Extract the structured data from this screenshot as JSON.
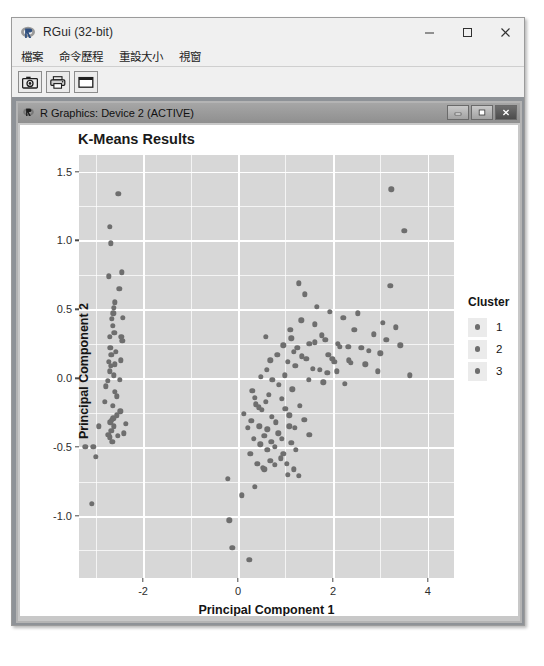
{
  "window": {
    "app_icon": "r-logo-icon",
    "title": "RGui (32-bit)",
    "minimize_label": "─",
    "maximize_label": "□",
    "close_label": "✕",
    "menus": [
      {
        "name": "file",
        "label": "檔案"
      },
      {
        "name": "history",
        "label": "命令歷程"
      },
      {
        "name": "resize",
        "label": "重設大小"
      },
      {
        "name": "windows",
        "label": "視窗"
      }
    ],
    "toolbar": [
      {
        "name": "copy-to-clipboard",
        "icon": "camera-icon"
      },
      {
        "name": "print",
        "icon": "printer-icon"
      },
      {
        "name": "window",
        "icon": "window-icon"
      }
    ]
  },
  "device_window": {
    "icon": "r-logo-icon",
    "title": "R Graphics: Device 2 (ACTIVE)",
    "minimize_label": "–",
    "restore_label": "□",
    "close_label": "✕"
  },
  "chart_data": {
    "type": "scatter",
    "title": "K-Means Results",
    "xlabel": "Principal Component 1",
    "ylabel": "Principal Component 2",
    "xlim": [
      -3.35,
      4.55
    ],
    "ylim": [
      -1.45,
      1.62
    ],
    "xticks": [
      -2,
      0,
      2,
      4
    ],
    "xtick_labels": [
      "-2",
      "0",
      "2",
      "4"
    ],
    "yticks": [
      -1.0,
      -0.5,
      0.0,
      0.5,
      1.0,
      1.5
    ],
    "ytick_labels": [
      "-1.0",
      "-0.5",
      "0.0",
      "0.5",
      "1.0",
      "1.5"
    ],
    "grid": true,
    "panel_bg": "#d7d7d7",
    "grid_color": "#ffffff",
    "legend": {
      "title": "Cluster",
      "position": "right",
      "entries": [
        {
          "label": "1",
          "color": "#6e6e6e"
        },
        {
          "label": "2",
          "color": "#6e6e6e"
        },
        {
          "label": "3",
          "color": "#6e6e6e"
        }
      ]
    },
    "series": [
      {
        "name": "1",
        "color": "#6e6e6e",
        "points": [
          [
            -2.52,
            1.34
          ],
          [
            -2.7,
            1.1
          ],
          [
            -2.68,
            0.98
          ],
          [
            -2.45,
            0.77
          ],
          [
            -2.72,
            0.74
          ],
          [
            -2.5,
            0.65
          ],
          [
            -2.6,
            0.55
          ],
          [
            -2.62,
            0.51
          ],
          [
            -2.63,
            0.47
          ],
          [
            -2.66,
            0.43
          ],
          [
            -2.64,
            0.38
          ],
          [
            -2.61,
            0.33
          ],
          [
            -2.7,
            0.3
          ],
          [
            -2.46,
            0.3
          ],
          [
            -2.44,
            0.27
          ],
          [
            -2.69,
            0.22
          ],
          [
            -2.67,
            0.17
          ],
          [
            -2.72,
            0.12
          ],
          [
            -2.68,
            0.09
          ],
          [
            -2.7,
            0.05
          ],
          [
            -2.62,
            0.02
          ],
          [
            -2.74,
            -0.02
          ],
          [
            -2.78,
            -0.06
          ],
          [
            -2.59,
            -0.1
          ],
          [
            -2.55,
            -0.13
          ],
          [
            -2.8,
            -0.17
          ],
          [
            -2.64,
            -0.2
          ],
          [
            -2.48,
            -0.24
          ],
          [
            -2.56,
            -0.27
          ],
          [
            -2.66,
            -0.3
          ],
          [
            -2.69,
            -0.32
          ],
          [
            -2.62,
            -0.35
          ],
          [
            -2.67,
            -0.38
          ],
          [
            -2.73,
            -0.41
          ],
          [
            -2.7,
            -0.43
          ],
          [
            -2.65,
            -0.46
          ],
          [
            -2.63,
            -0.29
          ],
          [
            -2.93,
            -0.35
          ],
          [
            -3.22,
            -0.5
          ],
          [
            -3.05,
            -0.5
          ],
          [
            -3.0,
            -0.57
          ],
          [
            -3.08,
            -0.91
          ],
          [
            -2.59,
            0.1
          ],
          [
            -2.47,
            0.13
          ],
          [
            -2.49,
            -0.01
          ],
          [
            -2.57,
            0.19
          ],
          [
            -2.53,
            -0.42
          ],
          [
            -2.41,
            -0.4
          ],
          [
            -2.36,
            -0.33
          ],
          [
            -2.43,
            0.44
          ]
        ]
      },
      {
        "name": "2",
        "color": "#6e6e6e",
        "points": [
          [
            1.28,
            0.69
          ],
          [
            1.94,
            0.48
          ],
          [
            1.33,
            0.42
          ],
          [
            1.1,
            0.35
          ],
          [
            1.12,
            0.29
          ],
          [
            1.77,
            0.31
          ],
          [
            1.84,
            0.28
          ],
          [
            1.62,
            0.26
          ],
          [
            1.5,
            0.25
          ],
          [
            2.1,
            0.25
          ],
          [
            2.15,
            0.23
          ],
          [
            2.32,
            0.23
          ],
          [
            1.18,
            0.19
          ],
          [
            1.35,
            0.16
          ],
          [
            1.44,
            0.14
          ],
          [
            1.9,
            0.17
          ],
          [
            1.99,
            0.14
          ],
          [
            2.03,
            0.12
          ],
          [
            2.34,
            0.13
          ],
          [
            2.37,
            0.11
          ],
          [
            1.21,
            0.09
          ],
          [
            1.57,
            0.07
          ],
          [
            1.72,
            0.06
          ],
          [
            1.88,
            0.04
          ],
          [
            2.08,
            0.05
          ],
          [
            3.05,
            0.4
          ],
          [
            3.21,
            0.67
          ],
          [
            3.23,
            1.37
          ],
          [
            3.5,
            1.07
          ],
          [
            2.86,
            0.32
          ],
          [
            3.32,
            0.37
          ],
          [
            3.42,
            0.24
          ],
          [
            2.6,
            0.22
          ],
          [
            2.75,
            0.2
          ],
          [
            3.0,
            0.18
          ],
          [
            3.12,
            0.28
          ],
          [
            2.45,
            0.35
          ],
          [
            1.66,
            0.52
          ],
          [
            2.22,
            0.44
          ],
          [
            2.52,
            0.47
          ],
          [
            1.41,
            0.61
          ],
          [
            1.25,
            0.22
          ],
          [
            1.62,
            0.39
          ],
          [
            2.68,
            0.1
          ],
          [
            3.62,
            0.02
          ],
          [
            2.95,
            0.05
          ],
          [
            1.05,
            0.12
          ],
          [
            1.49,
            -0.01
          ],
          [
            1.8,
            -0.03
          ],
          [
            2.25,
            -0.04
          ]
        ]
      },
      {
        "name": "3",
        "color": "#6e6e6e",
        "points": [
          [
            0.12,
            -0.26
          ],
          [
            0.38,
            -0.19
          ],
          [
            0.44,
            -0.21
          ],
          [
            0.5,
            -0.23
          ],
          [
            0.58,
            -0.17
          ],
          [
            0.28,
            -0.31
          ],
          [
            0.65,
            -0.12
          ],
          [
            0.71,
            -0.28
          ],
          [
            0.8,
            -0.32
          ],
          [
            0.92,
            -0.15
          ],
          [
            1.0,
            -0.22
          ],
          [
            1.08,
            -0.35
          ],
          [
            0.33,
            -0.44
          ],
          [
            0.47,
            -0.48
          ],
          [
            0.55,
            -0.42
          ],
          [
            0.62,
            -0.52
          ],
          [
            0.7,
            -0.46
          ],
          [
            0.85,
            -0.4
          ],
          [
            0.95,
            -0.55
          ],
          [
            1.12,
            -0.47
          ],
          [
            0.41,
            -0.62
          ],
          [
            0.52,
            -0.65
          ],
          [
            0.55,
            -0.66
          ],
          [
            0.68,
            -0.6
          ],
          [
            0.78,
            -0.63
          ],
          [
            0.9,
            -0.58
          ],
          [
            1.05,
            -0.7
          ],
          [
            1.22,
            -0.52
          ],
          [
            0.3,
            -0.09
          ],
          [
            0.2,
            -0.36
          ],
          [
            0.86,
            -0.05
          ],
          [
            1.14,
            -0.08
          ],
          [
            0.99,
            0.02
          ],
          [
            0.48,
            0.01
          ],
          [
            0.6,
            0.06
          ],
          [
            0.72,
            -0.01
          ],
          [
            1.3,
            -0.2
          ],
          [
            1.4,
            -0.3
          ],
          [
            1.5,
            -0.41
          ],
          [
            -0.22,
            -0.73
          ],
          [
            -0.18,
            -1.03
          ],
          [
            -0.12,
            -1.23
          ],
          [
            0.08,
            -0.85
          ],
          [
            0.24,
            -1.32
          ],
          [
            0.35,
            -0.79
          ],
          [
            0.68,
            0.13
          ],
          [
            0.83,
            0.17
          ],
          [
            0.95,
            0.24
          ],
          [
            0.58,
            0.3
          ],
          [
            1.03,
            -0.62
          ],
          [
            1.18,
            -0.66
          ],
          [
            1.28,
            -0.71
          ],
          [
            0.36,
            -0.14
          ],
          [
            0.45,
            -0.35
          ],
          [
            0.78,
            -0.5
          ],
          [
            0.92,
            -0.44
          ],
          [
            1.08,
            -0.27
          ],
          [
            1.2,
            -0.36
          ],
          [
            0.62,
            -0.37
          ],
          [
            0.26,
            -0.55
          ]
        ]
      }
    ]
  }
}
